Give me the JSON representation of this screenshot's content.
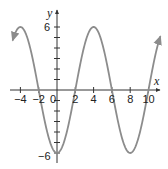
{
  "chart_data": {
    "type": "line",
    "title": "",
    "function": "y = -6cos(πx/4)",
    "xlabel": "x",
    "ylabel": "y",
    "xlim": [
      -5,
      10.8
    ],
    "ylim": [
      -6.5,
      6.5
    ],
    "x_ticks": [
      -4,
      -2,
      0,
      2,
      4,
      6,
      8,
      10
    ],
    "x_tick_labels": [
      "−4",
      "−2",
      "0",
      "2",
      "4",
      "6",
      "8",
      "10"
    ],
    "y_ticks": [
      -6,
      -5,
      -4,
      -3,
      -2,
      -1,
      1,
      2,
      3,
      4,
      5,
      6
    ],
    "y_tick_labels": [
      "6",
      "−6"
    ],
    "series": [
      {
        "name": "curve",
        "color": "#8c8c8c",
        "x": [
          -4.8,
          -4,
          -2,
          0,
          2,
          4,
          6,
          8,
          10,
          11.2
        ],
        "y": [
          4.85,
          6,
          0,
          -6,
          0,
          6,
          0,
          -6,
          0,
          4.85
        ]
      }
    ],
    "key_points": [
      {
        "x": -4,
        "y": 6
      },
      {
        "x": -2,
        "y": 0
      },
      {
        "x": 0,
        "y": -6
      },
      {
        "x": 2,
        "y": 0
      },
      {
        "x": 4,
        "y": 6
      },
      {
        "x": 6,
        "y": 0
      },
      {
        "x": 8,
        "y": -6
      },
      {
        "x": 10,
        "y": 0
      }
    ],
    "grid": false,
    "legend": null
  },
  "labels": {
    "x_axis": "x",
    "y_axis": "y",
    "x_ticks": [
      "−4",
      "−2",
      "0",
      "2",
      "4",
      "6",
      "8",
      "10"
    ],
    "y_max": "6",
    "y_min": "−6"
  }
}
